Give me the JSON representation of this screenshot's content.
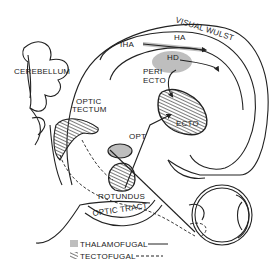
{
  "diagram": {
    "labels": {
      "visual_wulst": "VISUAL WULST",
      "iha": "IHA",
      "ha": "HA",
      "hd": "HD",
      "periecto_1": "PERI",
      "periecto_2": "ECTO",
      "ecto": "ECTO",
      "cerebellum": "CEREBELLUM",
      "optic_tectum_1": "OPTIC",
      "optic_tectum_2": "TECTUM",
      "opt": "OPT",
      "rotundus": "ROTUNDUS",
      "optic_tract": "OPTIC TRACT"
    },
    "legend": {
      "items": [
        {
          "label": "THALAMOFUGAL",
          "hatch": "vertical",
          "line": "solid"
        },
        {
          "label": "TECTOFUGAL",
          "hatch": "diagonal",
          "line": "dashed"
        }
      ]
    },
    "colors": {
      "ink": "#222222",
      "background": "#ffffff"
    }
  }
}
